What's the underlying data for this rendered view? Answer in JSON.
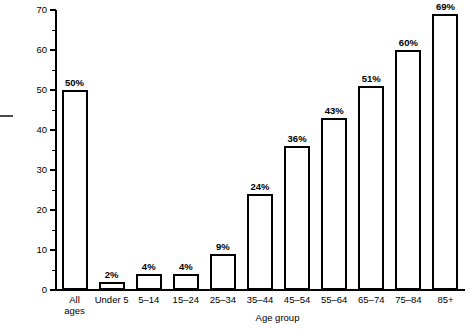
{
  "chart_data": {
    "type": "bar",
    "title": "",
    "subtitle": "",
    "xlabel": "Age group",
    "ylabel": "Percent",
    "ylim": [
      0,
      70
    ],
    "ytick_step": 10,
    "yminor_step": 5,
    "grid": false,
    "legend": false,
    "orientation": "vertical",
    "bar_style": "outline-white-fill-black-border",
    "ytick_labels": [
      "0",
      "10",
      "20",
      "30",
      "40",
      "50",
      "60",
      "70"
    ],
    "ytick_values": [
      0,
      10,
      20,
      30,
      40,
      50,
      60,
      70
    ],
    "categories": [
      "All ages",
      "Under 5",
      "5–14",
      "15–24",
      "25–34",
      "35–44",
      "45–54",
      "55–64",
      "65–74",
      "75–84",
      "85+"
    ],
    "category_lines": [
      [
        "All",
        "ages"
      ],
      [
        "Under 5",
        ""
      ],
      [
        "5–14",
        ""
      ],
      [
        "15–24",
        ""
      ],
      [
        "25–34",
        ""
      ],
      [
        "35–44",
        ""
      ],
      [
        "45–54",
        ""
      ],
      [
        "55–64",
        ""
      ],
      [
        "65–74",
        ""
      ],
      [
        "75–84",
        ""
      ],
      [
        "85+",
        ""
      ]
    ],
    "values": [
      50,
      2,
      4,
      4,
      9,
      24,
      36,
      43,
      51,
      60,
      69
    ],
    "data_labels": [
      "50%",
      "2%",
      "4%",
      "4%",
      "9%",
      "24%",
      "36%",
      "43%",
      "51%",
      "60%",
      "69%"
    ],
    "colors": {
      "bar_fill": "#ffffff",
      "bar_stroke": "#000000",
      "axis": "#000000",
      "text": "#000000",
      "background": "#ffffff"
    }
  }
}
